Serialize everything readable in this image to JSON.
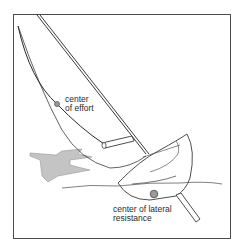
{
  "diagram": {
    "labels": {
      "center_of_effort": [
        "center",
        "of effort"
      ],
      "center_of_lateral_resistance": [
        "center of lateral",
        "resistance"
      ]
    },
    "colors": {
      "line": "#3a3a3a",
      "frame": "#4a4a4a",
      "wind_arrow_fill": "#c4c4c4",
      "marker_fill": "#9a9a9a",
      "background": "#ffffff"
    }
  }
}
